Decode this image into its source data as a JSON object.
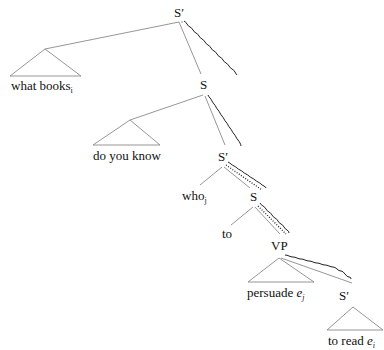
{
  "figure": {
    "number_label": "",
    "nodes": {
      "root": {
        "label": "S′"
      },
      "what_books": {
        "label": "what books",
        "sub": "i"
      },
      "s1": {
        "label": "S"
      },
      "do_you_know": {
        "label": "do you know"
      },
      "sbar2": {
        "label": "S′"
      },
      "who": {
        "label": "who",
        "sub": "j"
      },
      "s2": {
        "label": "S"
      },
      "to": {
        "label": "to"
      },
      "vp": {
        "label": "VP"
      },
      "persuade": {
        "label": "persuade",
        "var": "e",
        "sub": "j"
      },
      "sbar3": {
        "label": "S′"
      },
      "to_read": {
        "label": "to read",
        "var": "e",
        "sub": "i"
      }
    },
    "paths": {
      "wavy": "path of index i (what books → e_i)",
      "dotted": "path of index j (who → e_j)"
    }
  }
}
